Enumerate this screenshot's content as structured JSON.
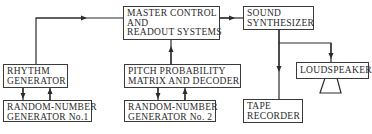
{
  "diagram": {
    "type": "block-diagram",
    "stroke_color": "#2a2a2a",
    "background": "#ffffff",
    "nodes": [
      {
        "id": "master",
        "lines": [
          "MASTER CONTROL",
          "AND",
          "READOUT SYSTEMS"
        ]
      },
      {
        "id": "synth",
        "lines": [
          "SOUND",
          "SYNTHESIZER"
        ]
      },
      {
        "id": "rhythm",
        "lines": [
          "RHYTHM",
          "GENERATOR"
        ]
      },
      {
        "id": "rng1",
        "lines": [
          "RANDOM-NUMBER",
          "GENERATOR No.1"
        ]
      },
      {
        "id": "pitch",
        "lines": [
          "PITCH PROBABILITY",
          "MATRIX AND DECODER"
        ]
      },
      {
        "id": "rng2",
        "lines": [
          "RANDOM-NUMBER",
          "GENERATOR No. 2"
        ]
      },
      {
        "id": "tape",
        "lines": [
          "TAPE",
          "RECORDER"
        ]
      },
      {
        "id": "speaker",
        "lines": [
          "LOUDSPEAKER"
        ]
      }
    ],
    "edges": [
      {
        "from": "rhythm",
        "to": "master"
      },
      {
        "from": "pitch",
        "to": "master"
      },
      {
        "from": "master",
        "to": "synth"
      },
      {
        "from": "synth",
        "to": "tape"
      },
      {
        "from": "synth",
        "to": "speaker"
      },
      {
        "from": "rhythm",
        "to": "rng1"
      },
      {
        "from": "rng1",
        "to": "rhythm"
      },
      {
        "from": "pitch",
        "to": "rng2"
      },
      {
        "from": "rng2",
        "to": "pitch"
      }
    ]
  }
}
